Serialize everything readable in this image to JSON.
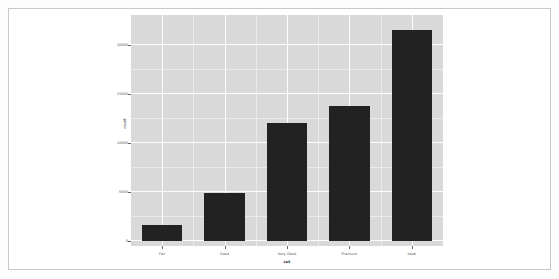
{
  "chart_data": {
    "type": "bar",
    "title": "",
    "subtitle": "",
    "xlabel": "cut",
    "ylabel": "count",
    "categories": [
      "Fair",
      "Good",
      "Very Good",
      "Premium",
      "Ideal"
    ],
    "values": [
      1610,
      4906,
      12082,
      13791,
      21551
    ],
    "series": [
      {
        "name": "count",
        "values": [
          1610,
          4906,
          12082,
          13791,
          21551
        ]
      }
    ],
    "ylim": [
      0,
      22500
    ],
    "xlim_categories": 5,
    "y_ticks": [
      0,
      5000,
      10000,
      15000,
      20000
    ],
    "y_tick_labels": [
      "0",
      "5000",
      "10000",
      "15000",
      "20000"
    ],
    "y_minor_ticks": [
      2500,
      7500,
      12500,
      17500
    ],
    "x_tick_labels": [
      "Fair",
      "Good",
      "Very Good",
      "Premium",
      "Ideal"
    ],
    "grid": true,
    "grid_color": "#ffffff",
    "panel_background": "#d9d9d9",
    "bar_color": "#222222",
    "legend": "none",
    "legend_position": "none",
    "annotations": []
  },
  "figure": {
    "axis_text_color": "#4d4d4d",
    "axis_title_color": "#2b2b2b",
    "frame_color": "#c9c9c9",
    "page_background": "#ffffff"
  }
}
